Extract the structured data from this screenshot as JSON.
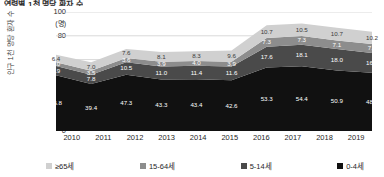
{
  "title": "연령별 1천 명당 환자 수",
  "y_axis": {
    "label": "인구 1천 명당 환자 수",
    "unit": "(명)",
    "ticks": [
      "100",
      "80",
      "60",
      "40",
      "20",
      "0"
    ]
  },
  "legend": [
    {
      "label": "≥65세",
      "color": "#d0d0d0",
      "key": "age65"
    },
    {
      "label": "15-64세",
      "color": "#8d8d8d",
      "key": "age15_64"
    },
    {
      "label": "5-14세",
      "color": "#4a4a4a",
      "key": "age5_14"
    },
    {
      "label": "0-4세",
      "color": "#111111",
      "key": "age0_4"
    }
  ],
  "chart_data": {
    "type": "area",
    "stacked": true,
    "title": "연령별 1천 명당 환자 수",
    "xlabel": "",
    "ylabel": "인구 1천 명당 환자 수",
    "yunit": "(명)",
    "ylim": [
      0,
      100
    ],
    "yticks": [
      0,
      20,
      40,
      60,
      80,
      100
    ],
    "grid": true,
    "legend_position": "bottom",
    "categories": [
      "2010",
      "2011",
      "2012",
      "2013",
      "2014",
      "2015",
      "2016",
      "2017",
      "2018",
      "2019"
    ],
    "series": [
      {
        "name": "0-4세",
        "color": "#111111",
        "values": [
          46.8,
          39.4,
          47.3,
          43.3,
          43.4,
          42.6,
          53.3,
          54.4,
          50.9,
          48.9
        ]
      },
      {
        "name": "5-14세",
        "color": "#4a4a4a",
        "values": [
          7.9,
          7.8,
          10.5,
          11.0,
          11.4,
          11.6,
          17.6,
          18.1,
          18.0,
          16.7
        ]
      },
      {
        "name": "15-64세",
        "color": "#8d8d8d",
        "values": [
          3.0,
          3.5,
          3.6,
          3.9,
          4.0,
          3.9,
          7.3,
          7.3,
          7.1,
          7.5
        ]
      },
      {
        "name": "≥65세",
        "color": "#d0d0d0",
        "values": [
          6.4,
          7.0,
          7.6,
          8.1,
          8.3,
          9.6,
          10.7,
          10.5,
          10.7,
          10.2
        ]
      }
    ],
    "totals": [
      64.1,
      57.7,
      69.0,
      66.3,
      67.1,
      67.7,
      88.9,
      90.3,
      86.7,
      83.3
    ]
  }
}
